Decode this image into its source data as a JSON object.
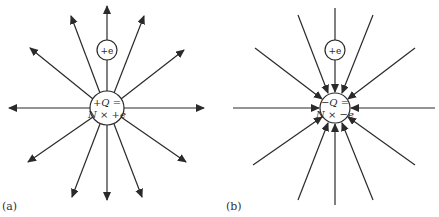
{
  "panels": [
    {
      "id": "a",
      "label": "(a)",
      "charge_sign": "positive",
      "center_label_line1": "+Q =",
      "center_label_line2": "N × +e",
      "test_charge_label": "+e",
      "field_direction": "outward"
    },
    {
      "id": "b",
      "label": "(b)",
      "charge_sign": "negative",
      "center_label_line1": "−Q =",
      "center_label_line2": "N × −e",
      "test_charge_label": "+e",
      "field_direction": "inward"
    }
  ],
  "colors": {
    "line": "#2a2a2a",
    "background": "#ffffff"
  }
}
